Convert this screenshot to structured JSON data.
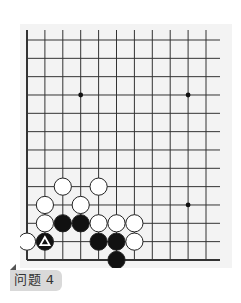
{
  "problem": {
    "label": "问题 4"
  },
  "board": {
    "columns": 11,
    "rows": 13,
    "origin_px": [
      27,
      40
    ],
    "spacing_px": [
      17.9,
      18.33
    ],
    "vertical_line_top_px": 30,
    "horizontal_line_right_px": 220,
    "edges": [
      "left",
      "bottom"
    ],
    "line_color": "#333333",
    "background": "#f3f3f3",
    "star_points": [
      [
        3,
        3
      ],
      [
        9,
        3
      ],
      [
        9,
        9
      ]
    ],
    "stones": [
      {
        "color": "white",
        "col": 2,
        "row": 8
      },
      {
        "color": "white",
        "col": 4,
        "row": 8
      },
      {
        "color": "white",
        "col": 1,
        "row": 9
      },
      {
        "color": "white",
        "col": 3,
        "row": 9
      },
      {
        "color": "white",
        "col": 1,
        "row": 10
      },
      {
        "color": "black",
        "col": 2,
        "row": 10
      },
      {
        "color": "black",
        "col": 3,
        "row": 10
      },
      {
        "color": "white",
        "col": 4,
        "row": 10
      },
      {
        "color": "white",
        "col": 5,
        "row": 10
      },
      {
        "color": "white",
        "col": 6,
        "row": 10
      },
      {
        "color": "white",
        "col": 0,
        "row": 11
      },
      {
        "color": "black",
        "col": 1,
        "row": 11,
        "mark": "triangle"
      },
      {
        "color": "black",
        "col": 4,
        "row": 11
      },
      {
        "color": "black",
        "col": 5,
        "row": 11
      },
      {
        "color": "white",
        "col": 6,
        "row": 11
      },
      {
        "color": "black",
        "col": 5,
        "row": 12
      }
    ]
  },
  "colors": {
    "black_stone": "#111111",
    "white_stone": "#ffffff",
    "stone_outline": "#222222",
    "mark": "#ffffff",
    "tab_background": "#d9d9d9"
  }
}
